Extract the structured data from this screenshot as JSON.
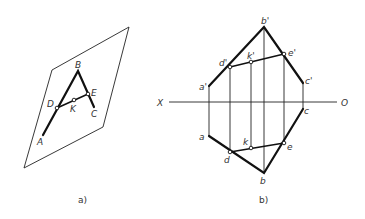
{
  "figure_a": {
    "caption": "a)",
    "labels": {
      "A": "A",
      "B": "B",
      "C": "C",
      "D": "D",
      "E": "E",
      "K": "K"
    }
  },
  "figure_b": {
    "caption": "b)",
    "axis": {
      "left": "X",
      "right": "O"
    },
    "labels_v": {
      "a": "a'",
      "b": "b'",
      "c": "c'",
      "d": "d'",
      "e": "e'",
      "k": "k'"
    },
    "labels_h": {
      "a": "a",
      "b": "b",
      "c": "c",
      "d": "d",
      "e": "e",
      "k": "k"
    }
  }
}
